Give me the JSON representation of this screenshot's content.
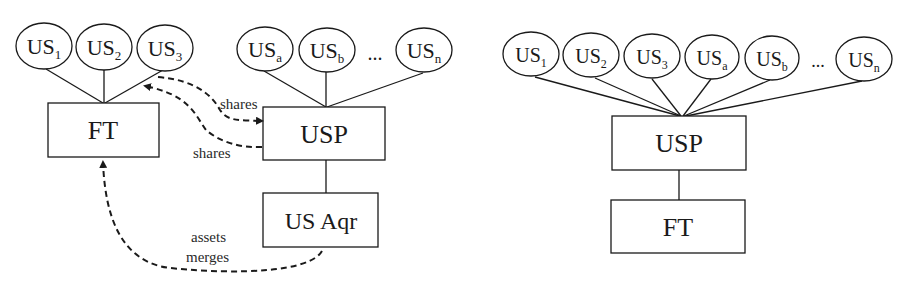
{
  "left_diagram": {
    "us_nodes": [
      {
        "base": "US",
        "sub": "1",
        "cx": 33,
        "cy": 47
      },
      {
        "base": "US",
        "sub": "2",
        "cx": 105,
        "cy": 47
      },
      {
        "base": "US",
        "sub": "3",
        "cx": 165,
        "cy": 48
      },
      {
        "base": "US",
        "sub": "a",
        "cx": 265,
        "cy": 49
      },
      {
        "base": "US",
        "sub": "b",
        "cx": 327,
        "cy": 50
      },
      {
        "base": "US",
        "sub": "n",
        "cx": 424,
        "cy": 50
      }
    ],
    "ellipsis": "...",
    "boxes": {
      "ft": "FT",
      "usp": "USP",
      "us_aqr": "US Aqr"
    },
    "arrow_labels": {
      "shares_to_usp": "shares",
      "shares_to_ft": "shares",
      "assets_merges_line1": "assets",
      "assets_merges_line2": "merges"
    }
  },
  "right_diagram": {
    "us_nodes": [
      {
        "base": "US",
        "sub": "1"
      },
      {
        "base": "US",
        "sub": "2"
      },
      {
        "base": "US",
        "sub": "3"
      },
      {
        "base": "US",
        "sub": "a"
      },
      {
        "base": "US",
        "sub": "b"
      },
      {
        "base": "US",
        "sub": "n"
      }
    ],
    "ellipsis": "...",
    "boxes": {
      "usp": "USP",
      "ft": "FT"
    }
  }
}
